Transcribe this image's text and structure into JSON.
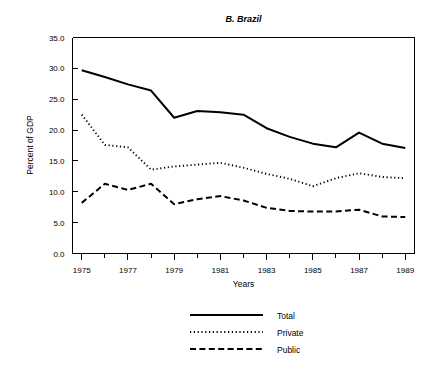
{
  "chart_data": {
    "type": "line",
    "title": "B. Brazil",
    "xlabel": "Years",
    "ylabel": "Percent of GDP",
    "xlim": [
      1974.6,
      1989.4
    ],
    "ylim": [
      0.0,
      35.0
    ],
    "grid": false,
    "legend_position": "bottom-center",
    "x": [
      1975,
      1976,
      1977,
      1978,
      1979,
      1980,
      1981,
      1982,
      1983,
      1984,
      1985,
      1986,
      1987,
      1988,
      1989
    ],
    "xticks": [
      1975,
      1977,
      1979,
      1981,
      1983,
      1985,
      1987,
      1989
    ],
    "xticklabels": [
      "1975",
      "1977",
      "1979",
      "1981",
      "1983",
      "1985",
      "1987",
      "1989"
    ],
    "xminorticks": [
      1976,
      1978,
      1980,
      1982,
      1984,
      1986,
      1988
    ],
    "yticks": [
      0.0,
      5.0,
      10.0,
      15.0,
      20.0,
      25.0,
      30.0,
      35.0
    ],
    "yticklabels": [
      "0.0",
      "5.0",
      "10.0",
      "15.0",
      "20.0",
      "25.0",
      "30.0",
      "35.0"
    ],
    "series": [
      {
        "name": "Total",
        "style": "solid",
        "color": "#000000",
        "values": [
          29.7,
          28.6,
          27.4,
          26.4,
          22.0,
          23.1,
          22.9,
          22.5,
          20.3,
          18.9,
          17.8,
          17.2,
          19.6,
          17.8,
          17.1
        ]
      },
      {
        "name": "Private",
        "style": "dotted",
        "color": "#000000",
        "values": [
          22.5,
          17.6,
          17.2,
          13.6,
          14.1,
          14.4,
          14.7,
          13.9,
          12.9,
          12.1,
          10.9,
          12.2,
          13.0,
          12.4,
          12.2
        ]
      },
      {
        "name": "Public",
        "style": "dashed",
        "color": "#000000",
        "values": [
          8.2,
          11.3,
          10.3,
          11.3,
          8.0,
          8.8,
          9.3,
          8.6,
          7.4,
          6.9,
          6.8,
          6.8,
          7.1,
          6.0,
          5.9
        ]
      }
    ]
  },
  "legend": {
    "items": [
      {
        "label": "Total",
        "style": "solid"
      },
      {
        "label": "Private",
        "style": "dotted"
      },
      {
        "label": "Public",
        "style": "dashed"
      }
    ]
  }
}
